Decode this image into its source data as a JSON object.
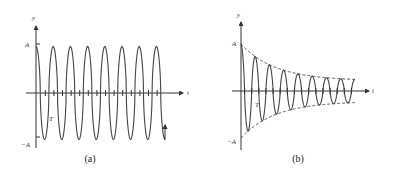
{
  "chart_data": [
    {
      "type": "line",
      "panel": "a",
      "caption": "(a)",
      "title": "Undamped oscillation",
      "xlabel": "t",
      "ylabel": "y",
      "y_tick_labels": [
        "A",
        "-A"
      ],
      "annotations": [
        "T"
      ],
      "amplitude": "A",
      "cycles": 7,
      "envelope": "constant",
      "function": "y = A cos(2πt/T)",
      "ylim": [
        "-A",
        "A"
      ],
      "grid": false
    },
    {
      "type": "line",
      "panel": "b",
      "caption": "(b)",
      "title": "Damped oscillation",
      "xlabel": "t",
      "ylabel": "y",
      "y_tick_labels": [
        "A",
        "-A"
      ],
      "annotations": [
        "T"
      ],
      "amplitude": "A",
      "cycles": 8,
      "envelope": "exponential decay (dashed)",
      "function": "y = A e^(-bt) cos(2πt/T)",
      "ylim": [
        "-A",
        "A"
      ],
      "grid": false
    }
  ],
  "panels": {
    "a": {
      "caption": "(a)",
      "y_axis": "y",
      "x_axis": "t",
      "pos_label": "A",
      "neg_label": "−A",
      "period_label": "T"
    },
    "b": {
      "caption": "(b)",
      "y_axis": "y",
      "x_axis": "t",
      "pos_label": "A",
      "neg_label": "−A",
      "period_label": "T"
    }
  },
  "colors": {
    "curve": "#444444",
    "axis": "#333333",
    "envelope": "#333333"
  }
}
